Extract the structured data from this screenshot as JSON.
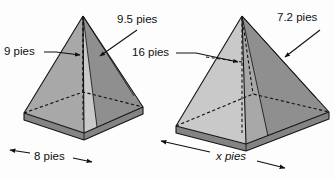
{
  "figure": {
    "units": "pies",
    "background_color": "#fdfdfd",
    "line_color": "#141414",
    "face_colors": {
      "light": "#c9c9c9",
      "mid": "#a8a8a8",
      "dark": "#8f8f8f",
      "base_top": "#9a9a9a",
      "base_side": "#848484"
    }
  },
  "pyramid_left": {
    "name": "left-pyramid",
    "labels": {
      "height": "9 pies",
      "slant": "9.5 pies",
      "base": "8 pies"
    }
  },
  "pyramid_right": {
    "name": "right-pyramid",
    "labels": {
      "apothem": "16 pies",
      "slant": "7.2 pies",
      "base": "x pies"
    }
  }
}
